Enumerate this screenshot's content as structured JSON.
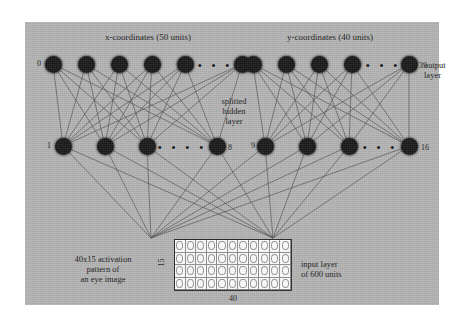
{
  "figure": {
    "background_color": "#b4b4b4",
    "node_color": "#1a1a1a",
    "grid_color": "#ffffff"
  },
  "headings": {
    "x_group": "x-coordinates (50 units)",
    "y_group": "y-coordinates (40 units)"
  },
  "labels": {
    "output_layer": "output\nlayer",
    "output_layer_line1": "output",
    "output_layer_line2": "layer",
    "hidden_layer_line1": "splitted",
    "hidden_layer_line2": "hidden",
    "hidden_layer_line3": "layer",
    "activation_line1": "40x15 activation",
    "activation_line2": "pattern of",
    "activation_line3": "an eye image",
    "input_layer_line1": "input layer",
    "input_layer_line2": "of 600 units"
  },
  "output_layer": {
    "x_group": {
      "start_label": "0",
      "end_label": "49",
      "visible_nodes": 6,
      "ellipsis": "• • •"
    },
    "y_group": {
      "start_label": "0",
      "end_label": "39",
      "visible_nodes": 6,
      "ellipsis": "• • •"
    }
  },
  "hidden_layer": {
    "left_group": {
      "start_label": "1",
      "end_label": "8",
      "visible_nodes": 4,
      "ellipsis": "• • • •"
    },
    "right_group": {
      "start_label": "9",
      "end_label": "16",
      "visible_nodes": 4,
      "ellipsis": "• • •"
    }
  },
  "input_grid": {
    "rows": 4,
    "cols": 11,
    "height_label": "15",
    "width_label": "40",
    "total_units": "600"
  },
  "chart_data": {
    "type": "diagram",
    "layers": [
      {
        "name": "output layer",
        "groups": [
          {
            "name": "x-coordinates",
            "units": 50,
            "index_range": [
              0,
              49
            ]
          },
          {
            "name": "y-coordinates",
            "units": 40,
            "index_range": [
              0,
              39
            ]
          }
        ]
      },
      {
        "name": "splitted hidden layer",
        "groups": [
          {
            "name": "left half",
            "units": 8,
            "index_range": [
              1,
              8
            ]
          },
          {
            "name": "right half",
            "units": 8,
            "index_range": [
              9,
              16
            ]
          }
        ]
      },
      {
        "name": "input layer",
        "groups": [
          {
            "name": "eye image activation pattern",
            "units": 600,
            "shape": [
              40,
              15
            ]
          }
        ]
      }
    ]
  }
}
